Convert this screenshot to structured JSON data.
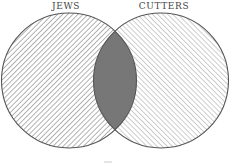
{
  "diagram": {
    "type": "venn",
    "sets": [
      {
        "label": "JEWS",
        "cx": 69,
        "cy": 80.5,
        "r": 67.5,
        "hatch": "diagonal-down"
      },
      {
        "label": "CUTTERS",
        "cx": 161,
        "cy": 80.5,
        "r": 67.5,
        "hatch": "diagonal-up"
      }
    ],
    "intersection": {
      "fill": "#777777"
    },
    "colors": {
      "stroke": "#555555",
      "hatch_left": "#8a8a8a",
      "hatch_right": "#a5a5a5",
      "background": "#ffffff"
    }
  }
}
